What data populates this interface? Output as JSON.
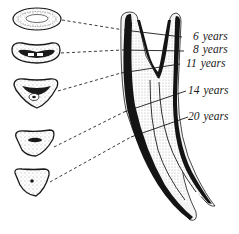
{
  "diagram": {
    "labels": [
      {
        "age": "6",
        "unit": "years"
      },
      {
        "age": "8",
        "unit": "years"
      },
      {
        "age": "11",
        "unit": "years"
      },
      {
        "age": "14",
        "unit": "years"
      },
      {
        "age": "20",
        "unit": "years"
      }
    ],
    "cross_sections": [
      {
        "id": "section-6-years",
        "shape": "oval"
      },
      {
        "id": "section-8-years",
        "shape": "kidney"
      },
      {
        "id": "section-11-years",
        "shape": "rounded-triangle"
      },
      {
        "id": "section-14-years",
        "shape": "rounded-triangle"
      },
      {
        "id": "section-20-years",
        "shape": "rounded-triangle"
      }
    ],
    "colors": {
      "ink": "#1a1a1a",
      "background": "#ffffff",
      "stipple": "#555555"
    }
  }
}
